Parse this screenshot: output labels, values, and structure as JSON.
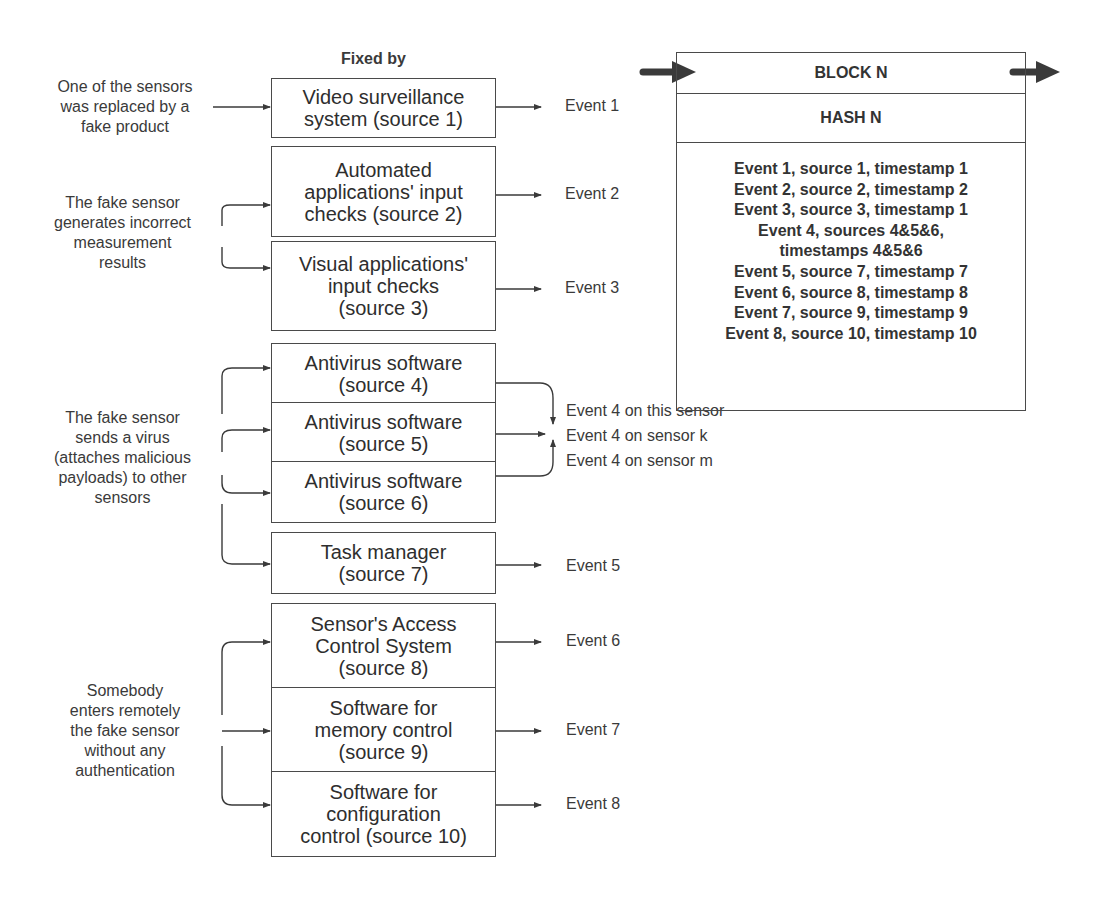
{
  "header": {
    "fixed_by": "Fixed by"
  },
  "threats": [
    {
      "id": "replaced",
      "text": "One of the sensors\nwas replaced by a\nfake product"
    },
    {
      "id": "incorrect",
      "text": "The fake sensor\ngenerates incorrect\nmeasurement\nresults"
    },
    {
      "id": "virus",
      "text": "The fake sensor\nsends a virus\n(attaches malicious\npayloads) to other\nsensors"
    },
    {
      "id": "remote",
      "text": "Somebody\nenters remotely\nthe fake sensor\nwithout any\nauthentication"
    }
  ],
  "sources": [
    {
      "label": "Video surveillance\nsystem (source 1)"
    },
    {
      "label": "Automated\napplications' input\nchecks (source 2)"
    },
    {
      "label": "Visual applications'\ninput checks\n(source 3)"
    },
    {
      "label": "Antivirus software\n(source 4)"
    },
    {
      "label": "Antivirus software\n(source 5)"
    },
    {
      "label": "Antivirus software\n(source 6)"
    },
    {
      "label": "Task manager\n(source 7)"
    },
    {
      "label": "Sensor's Access\nControl System\n(source 8)"
    },
    {
      "label": "Software for\nmemory control\n(source 9)"
    },
    {
      "label": "Software for\nconfiguration\ncontrol (source 10)"
    }
  ],
  "events": {
    "e1": "Event 1",
    "e2": "Event 2",
    "e3": "Event 3",
    "e4_this": "Event 4 on this sensor",
    "e4_k": "Event 4 on sensor k",
    "e4_m": "Event 4 on sensor m",
    "e5": "Event 5",
    "e6": "Event 6",
    "e7": "Event 7",
    "e8": "Event 8"
  },
  "block": {
    "title": "BLOCK N",
    "hash": "HASH N",
    "entries": [
      "Event 1, source 1, timestamp 1",
      "Event 2, source 2, timestamp 2",
      "Event 3, source 3, timestamp 1",
      "Event 4, sources 4&5&6,",
      "timestamps 4&5&6",
      "Event 5, source 7, timestamp 7",
      "Event 6, source 8, timestamp 8",
      "Event 7, source 9, timestamp 9",
      "Event 8, source 10, timestamp 10"
    ]
  },
  "colors": {
    "line": "#4a4a4a",
    "text": "#3a3a3a",
    "background": "#ffffff"
  }
}
